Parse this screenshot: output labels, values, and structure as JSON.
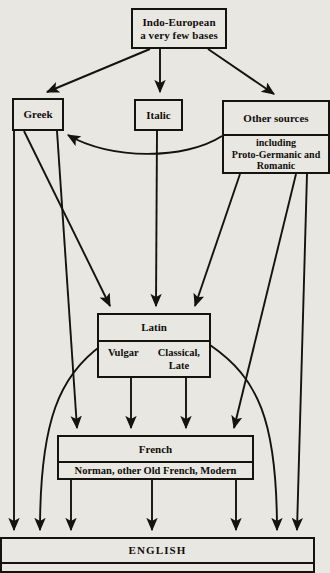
{
  "diagram": {
    "background_color": "#e9e7e2",
    "line_color": "#15130f",
    "nodes": {
      "indo_european": {
        "line1": "Indo-European",
        "line2": "a very few bases"
      },
      "greek": {
        "label": "Greek"
      },
      "italic": {
        "label": "Italic"
      },
      "other_sources": {
        "header": "Other sources",
        "body_line1": "including",
        "body_line2": "Proto-Germanic and",
        "body_line3": "Romanic"
      },
      "latin": {
        "header": "Latin",
        "left": "Vulgar",
        "right_line1": "Classical,",
        "right_line2": "Late"
      },
      "french": {
        "header": "French",
        "body": "Norman, other Old French, Modern"
      },
      "english": {
        "header": "ENGLISH",
        "cutoff_row": ""
      }
    },
    "edges": [
      {
        "from": "indo_european",
        "to": "greek",
        "style": "arrow"
      },
      {
        "from": "indo_european",
        "to": "italic",
        "style": "arrow"
      },
      {
        "from": "indo_european",
        "to": "other_sources",
        "style": "arrow"
      },
      {
        "from": "other_sources",
        "to": "greek",
        "style": "curved-arrow"
      },
      {
        "from": "greek",
        "to": "latin",
        "style": "arrow"
      },
      {
        "from": "italic",
        "to": "latin",
        "style": "arrow"
      },
      {
        "from": "other_sources",
        "to": "latin",
        "style": "arrow"
      },
      {
        "from": "greek",
        "to": "french",
        "style": "arrow"
      },
      {
        "from": "latin",
        "to": "french",
        "style": "arrow"
      },
      {
        "from": "other_sources",
        "to": "french",
        "style": "arrow"
      },
      {
        "from": "greek",
        "to": "english",
        "style": "arrow"
      },
      {
        "from": "latin",
        "to": "english",
        "style": "curved-arrow"
      },
      {
        "from": "french",
        "to": "english",
        "style": "arrow"
      },
      {
        "from": "other_sources",
        "to": "english",
        "style": "arrow"
      }
    ]
  }
}
